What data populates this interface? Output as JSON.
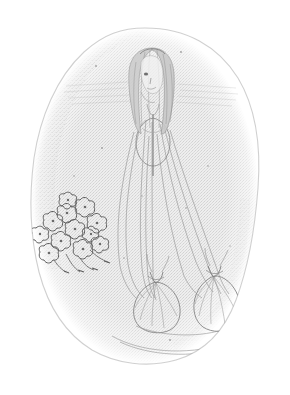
{
  "image": {
    "kind": "pencil-sketch",
    "title": "Faint graphite sketch of a veiled standing figure",
    "medium": "graphite pencil on paper, stippled halftone reproduction",
    "orientation": "portrait",
    "width_px": 290,
    "height_px": 395,
    "background_color": "#ffffff",
    "paper_tone_color": "#e6e6e6",
    "vignette_tone_color": "#dedede",
    "line_color": "#8a8a8a",
    "dark_line_color": "#6e6e6e",
    "flower_outline_color": "#5f5f5f",
    "alt_text": "A very faint pencil drawing contained within an irregular oval patch of gray tone. A standing figure with long parted hair wears a long gown or veil whose fabric fans out in thin diagonal lines to two gathered drawstring pouches near the bottom. A cluster of small outlined blossoms with trailing stems sits at the lower left."
  },
  "vignette": {
    "name": "oval-tone-patch",
    "shape": "irregular egg-shaped oval, wider at bottom",
    "bounds": {
      "left": 30,
      "top": 28,
      "right": 260,
      "bottom": 364
    },
    "fill": "#e4e4e4",
    "edge": "soft stippled, darker along upper-left rim"
  },
  "figure": {
    "name": "veiled-standing-figure",
    "head": {
      "center_x": 152,
      "center_y": 72,
      "width": 26,
      "height": 34,
      "description": "oval head seen three-quarter, faint facial marks for eye and nose"
    },
    "hair": {
      "description": "long dark-parted hair falling past the shoulders on both sides",
      "top_y": 48,
      "bottom_y": 130
    },
    "bodice": {
      "description": "rounded torso / bodice outline with a vertical center seam",
      "center_x": 153,
      "center_y": 140,
      "width": 30,
      "height": 44
    },
    "veil": {
      "description": "long thin diagonal fabric lines fanning from the shoulders down to the two pouches",
      "line_count": 9,
      "top_y": 118,
      "bottom_y": 300
    }
  },
  "pouches": [
    {
      "name": "left-gathered-pouch",
      "center_x": 158,
      "center_y": 300,
      "width": 44,
      "height": 52,
      "description": "drawstring bag with gathered neck and radiating folds"
    },
    {
      "name": "right-gathered-pouch",
      "center_x": 214,
      "center_y": 296,
      "width": 44,
      "height": 54,
      "description": "drawstring bag with gathered neck and radiating folds"
    }
  ],
  "flower_cluster": {
    "name": "blossom-cluster",
    "center_x": 74,
    "center_y": 232,
    "width": 62,
    "height": 68,
    "blossom_count": 12,
    "description": "loose cluster of small five-lobed outlined blossoms with short trailing stems toward the lower right",
    "stem_count": 4
  }
}
